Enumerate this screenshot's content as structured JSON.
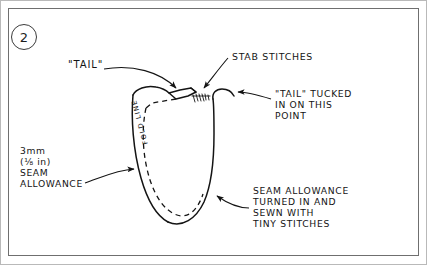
{
  "figure": {
    "step_number": "2",
    "type": "sewing-instruction-diagram",
    "ink_color": "#141414",
    "panel_border_color": "#6f6f6f",
    "background_color": "#ffffff"
  },
  "labels": {
    "tail": "\"TAIL\"",
    "stab_stitches": "STAB STITCHES",
    "tail_tucked": "\"TAIL\" TUCKED\nIN ON THIS\nPOINT",
    "seam_allowance_left_size_mm": "3mm",
    "seam_allowance_left_size_in": "(⅛ in)",
    "seam_allowance_left_text": "SEAM\nALLOWANCE",
    "seam_allowance_right": "SEAM ALLOWANCE\nTURNED IN AND\nSEWN WITH\nTINY STITCHES",
    "fold_line": "FOLD LINE"
  }
}
